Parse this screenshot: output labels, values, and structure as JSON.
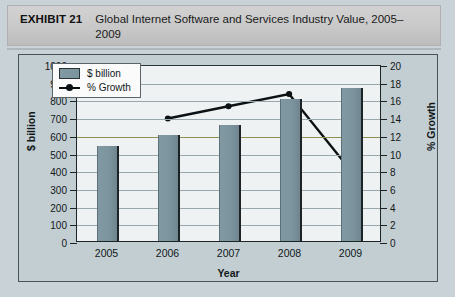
{
  "header": {
    "exhibit_label": "EXHIBIT 21",
    "title": "Global Internet Software and Services Industry Value, 2005–2009"
  },
  "legend": {
    "bar_label": "$ billion",
    "line_label": "% Growth"
  },
  "chart_data": {
    "type": "bar",
    "title": "Global Internet Software and Services Industry Value, 2005–2009",
    "xlabel": "Year",
    "ylabel": "$ billion",
    "y2label": "% Growth",
    "categories": [
      "2005",
      "2006",
      "2007",
      "2008",
      "2009"
    ],
    "ylim": [
      0,
      1000
    ],
    "y2lim": [
      0,
      20
    ],
    "yticks": [
      0,
      100,
      200,
      300,
      400,
      500,
      600,
      700,
      800,
      900,
      1000
    ],
    "y2ticks": [
      0,
      2,
      4,
      6,
      8,
      10,
      12,
      14,
      16,
      18,
      20
    ],
    "grid": true,
    "legend_position": "top-left",
    "series": [
      {
        "name": "$ billion",
        "type": "bar",
        "axis": "left",
        "color": "#7c949e",
        "values": [
          535,
          600,
          655,
          800,
          865
        ]
      },
      {
        "name": "% Growth",
        "type": "line",
        "axis": "right",
        "color": "#0c1113",
        "values": [
          null,
          14.0,
          15.4,
          16.8,
          8.2
        ]
      }
    ]
  }
}
